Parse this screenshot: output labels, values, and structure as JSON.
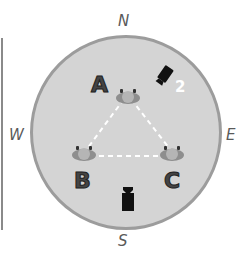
{
  "compass": {
    "north": "N",
    "south": "S",
    "east": "E",
    "west": "W"
  },
  "positions": [
    {
      "id": "A",
      "label": "A"
    },
    {
      "id": "B",
      "label": "B"
    },
    {
      "id": "C",
      "label": "C"
    }
  ],
  "cameras": [
    {
      "id": "camera-2",
      "label": "2"
    },
    {
      "id": "camera-1",
      "label": ""
    }
  ],
  "colors": {
    "arena_fill": "#d4d4d4",
    "arena_border": "#9c9c9c",
    "figure_body": "#8e8e8e",
    "figure_head": "#b5b5b5",
    "camera": "#111111",
    "connector": "#ffffff"
  }
}
